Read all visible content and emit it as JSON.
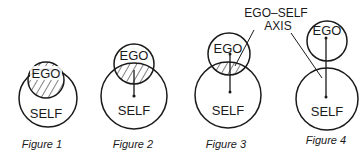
{
  "diagram": {
    "labels": {
      "ego": "EGO",
      "self": "SELF",
      "axis_line1": "EGO–SELF",
      "axis_line2": "AXIS"
    },
    "figures": [
      {
        "caption": "Figure 1",
        "description": "Ego circle entirely inside Self circle, fully hatched"
      },
      {
        "caption": "Figure 2",
        "description": "Ego partially emerging from Self, large hatched overlap, axis line"
      },
      {
        "caption": "Figure 3",
        "description": "Ego mostly separated, small hatched overlap, ego-self axis"
      },
      {
        "caption": "Figure 4",
        "description": "Ego touching Self, no overlap, ego-self axis line connecting centers"
      }
    ],
    "colors": {
      "stroke": "#1a1a1a",
      "background": "#ffffff"
    }
  }
}
